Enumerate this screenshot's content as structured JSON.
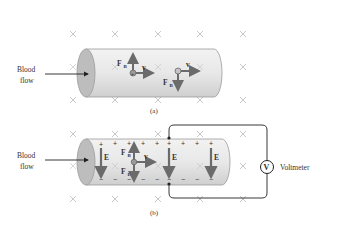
{
  "figure": {
    "panel_a": {
      "caption": "(a)",
      "inlet_label_line1": "Blood",
      "inlet_label_line2": "flow",
      "particle_pos": {
        "charge_symbol": "+",
        "force_label": "F",
        "force_sub": "B",
        "velocity_label": "v"
      },
      "particle_neg": {
        "force_label": "F",
        "force_sub": "B",
        "velocity_label": "v"
      }
    },
    "panel_b": {
      "caption": "(b)",
      "inlet_label_line1": "Blood",
      "inlet_label_line2": "flow",
      "field_label": "E",
      "force_b_label": "F",
      "force_b_sub": "B",
      "force_e_label": "F",
      "force_e_sub": "E",
      "velocity_label": "v",
      "top_charge": "+",
      "bottom_charge": "−",
      "meter_symbol": "V",
      "meter_label": "Voltmeter"
    },
    "colors": {
      "vessel_fill": "#e6e6e6",
      "vessel_cap": "#bdbdbd",
      "arrow": "#6b6b6b",
      "cross": "#c8c8c8",
      "text": "#333333"
    }
  }
}
